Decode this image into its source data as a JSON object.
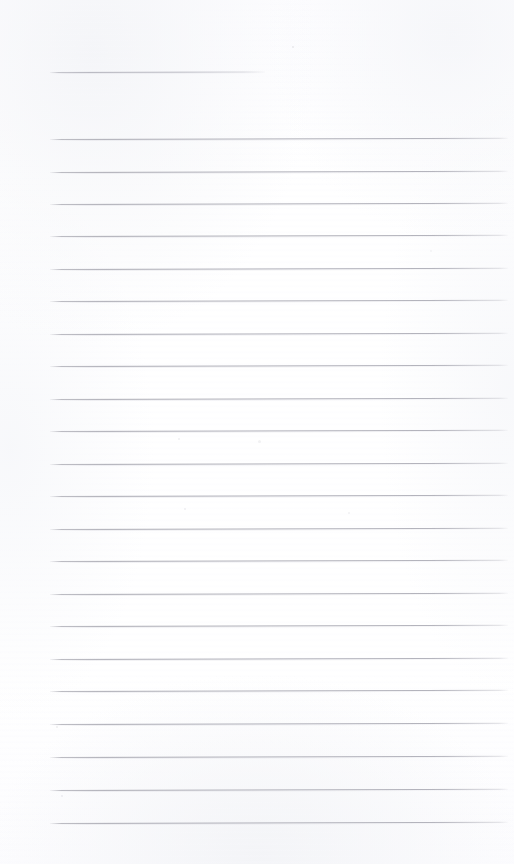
{
  "document": {
    "kind": "scanned-ruled-notebook-page",
    "page_label": "",
    "title_text": "",
    "body_text": "",
    "background_color": "#ffffff",
    "rule_color": "#acacb5",
    "rule_halo_color": "#e0e0e6",
    "page_width": 514,
    "page_height": 864
  },
  "layout": {
    "rule_left_x": 50,
    "rule_right_x": 508,
    "title_rule_right_x": 265,
    "title_rule_y": 72,
    "first_body_rule_y": 139,
    "last_body_rule_y": 823,
    "rule_spacing_px": 32.5,
    "rule_thickness_px": 1,
    "rule_slant_deg": -0.16,
    "body_rule_count": 22
  },
  "rules": [
    {
      "name": "title-rule",
      "y": 72,
      "x1": 50,
      "x2": 265,
      "kind": "title"
    },
    {
      "name": "body-rule-1",
      "y": 139,
      "x1": 50,
      "x2": 508,
      "kind": "body"
    },
    {
      "name": "body-rule-2",
      "y": 172,
      "x1": 50,
      "x2": 508,
      "kind": "body"
    },
    {
      "name": "body-rule-3",
      "y": 204,
      "x1": 50,
      "x2": 508,
      "kind": "body"
    },
    {
      "name": "body-rule-4",
      "y": 236,
      "x1": 50,
      "x2": 508,
      "kind": "body"
    },
    {
      "name": "body-rule-5",
      "y": 269,
      "x1": 50,
      "x2": 508,
      "kind": "body"
    },
    {
      "name": "body-rule-6",
      "y": 301,
      "x1": 50,
      "x2": 508,
      "kind": "body"
    },
    {
      "name": "body-rule-7",
      "y": 334,
      "x1": 50,
      "x2": 508,
      "kind": "body"
    },
    {
      "name": "body-rule-8",
      "y": 366,
      "x1": 50,
      "x2": 508,
      "kind": "body"
    },
    {
      "name": "body-rule-9",
      "y": 399,
      "x1": 50,
      "x2": 508,
      "kind": "body"
    },
    {
      "name": "body-rule-10",
      "y": 431,
      "x1": 50,
      "x2": 508,
      "kind": "body"
    },
    {
      "name": "body-rule-11",
      "y": 464,
      "x1": 50,
      "x2": 508,
      "kind": "body"
    },
    {
      "name": "body-rule-12",
      "y": 496,
      "x1": 50,
      "x2": 508,
      "kind": "body"
    },
    {
      "name": "body-rule-13",
      "y": 529,
      "x1": 50,
      "x2": 508,
      "kind": "body"
    },
    {
      "name": "body-rule-14",
      "y": 561,
      "x1": 50,
      "x2": 508,
      "kind": "body"
    },
    {
      "name": "body-rule-15",
      "y": 594,
      "x1": 50,
      "x2": 508,
      "kind": "body"
    },
    {
      "name": "body-rule-16",
      "y": 626,
      "x1": 50,
      "x2": 508,
      "kind": "body"
    },
    {
      "name": "body-rule-17",
      "y": 659,
      "x1": 50,
      "x2": 508,
      "kind": "body"
    },
    {
      "name": "body-rule-18",
      "y": 691,
      "x1": 50,
      "x2": 508,
      "kind": "body"
    },
    {
      "name": "body-rule-19",
      "y": 724,
      "x1": 50,
      "x2": 508,
      "kind": "body"
    },
    {
      "name": "body-rule-20",
      "y": 757,
      "x1": 50,
      "x2": 508,
      "kind": "body"
    },
    {
      "name": "body-rule-21",
      "y": 790,
      "x1": 50,
      "x2": 508,
      "kind": "body"
    },
    {
      "name": "body-rule-22",
      "y": 823,
      "x1": 50,
      "x2": 508,
      "kind": "body"
    }
  ],
  "specks": [
    {
      "x": 292,
      "y": 46,
      "size": 2,
      "opacity": 0.18
    },
    {
      "x": 178,
      "y": 438,
      "size": 2,
      "opacity": 0.14
    },
    {
      "x": 258,
      "y": 440,
      "size": 3,
      "opacity": 0.12
    },
    {
      "x": 184,
      "y": 508,
      "size": 2,
      "opacity": 0.15
    },
    {
      "x": 348,
      "y": 512,
      "size": 2,
      "opacity": 0.13
    },
    {
      "x": 56,
      "y": 726,
      "size": 2,
      "opacity": 0.16
    },
    {
      "x": 61,
      "y": 795,
      "size": 2,
      "opacity": 0.15
    },
    {
      "x": 430,
      "y": 250,
      "size": 2,
      "opacity": 0.1
    }
  ]
}
